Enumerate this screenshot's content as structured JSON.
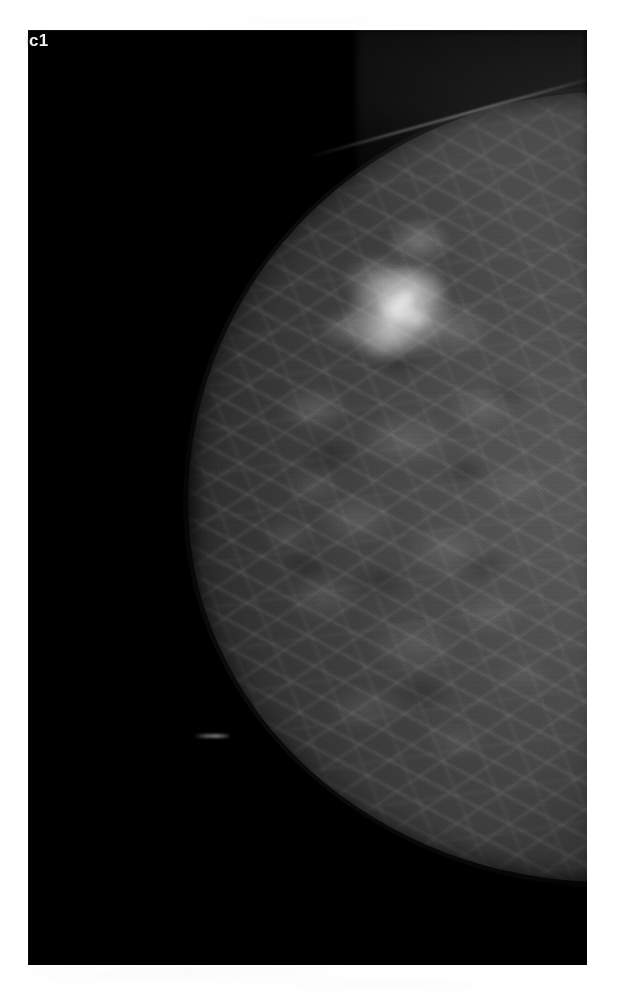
{
  "figure": {
    "label": "c1",
    "modality": "mammogram",
    "view": "craniocaudal",
    "background_color": "#ffffff",
    "film_color": "#000000",
    "label_color": "#f2f2f2"
  },
  "film": {
    "x": 28,
    "y": 30,
    "width": 559,
    "height": 935
  },
  "findings": [
    {
      "name": "dense-fibroglandular-opacity",
      "description": "focal dense asymmetric opacity, upper region",
      "x": 300,
      "y": 220,
      "width": 150,
      "height": 135
    },
    {
      "name": "pectoral-muscle",
      "description": "diagonal muscle band at upper right / chest wall"
    },
    {
      "name": "nipple-in-profile",
      "description": "anterior nipple marker at left breast border",
      "x": 166,
      "y": 704
    }
  ]
}
